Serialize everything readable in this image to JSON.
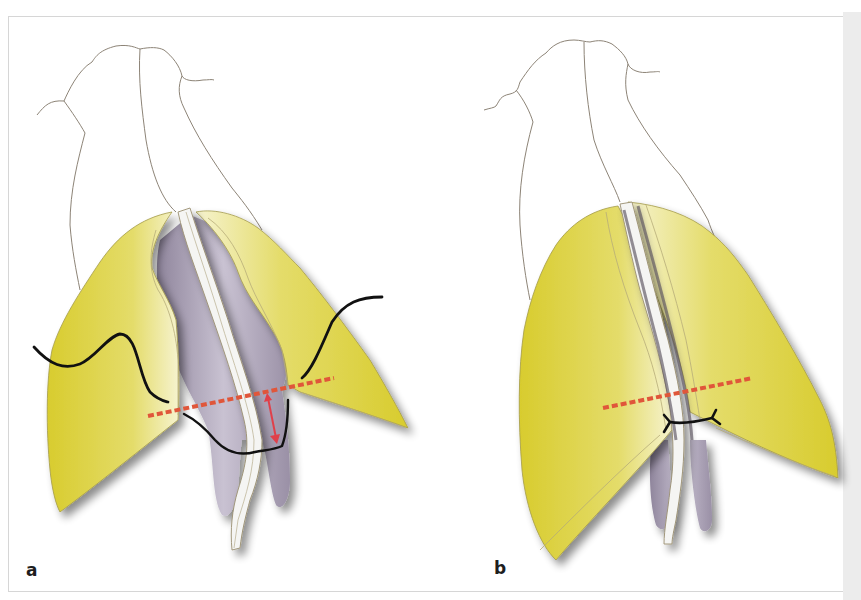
{
  "figure": {
    "colors": {
      "cartilage": "#d9cf3a",
      "cartilage_light": "#f3f0c4",
      "mucosa": "#a9a0b5",
      "septum": "#f4f4f2",
      "outline": "#8a7f6e",
      "suture": "#111111",
      "dashed_line": "#e0563a",
      "arrow": "#e0404a",
      "frame_border": "#d6d6d6"
    },
    "panels": [
      {
        "label": "a",
        "elements": [
          "nasal-bone-outline",
          "lateral-crura",
          "medial-crura",
          "septum-strut",
          "suture-thread",
          "dashed-reference-line",
          "red-arrow"
        ]
      },
      {
        "label": "b",
        "elements": [
          "nasal-bone-outline",
          "lateral-crura",
          "medial-crura",
          "septum-strut",
          "tied-suture",
          "dashed-reference-line"
        ]
      }
    ]
  }
}
